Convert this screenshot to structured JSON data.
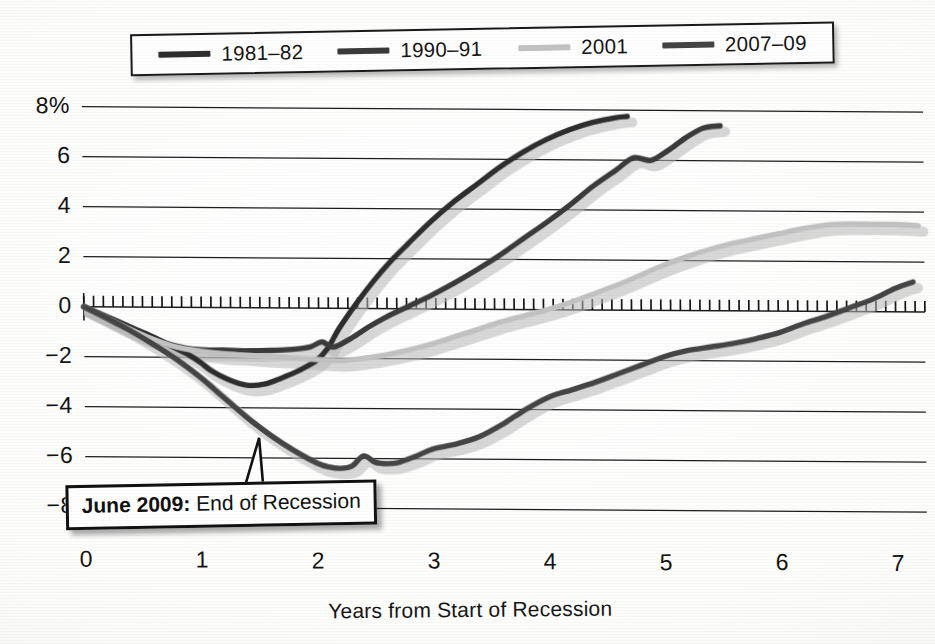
{
  "figure": {
    "background_color": "#fdfdfb",
    "ink_color": "#1a1a1a"
  },
  "legend": {
    "position": "top",
    "entries": [
      {
        "label": "1981–82",
        "color": "#2e2e2e"
      },
      {
        "label": "1990–91",
        "color": "#3a3a3a"
      },
      {
        "label": "2001",
        "color": "#c2c2c2"
      },
      {
        "label": "2007–09",
        "color": "#444444"
      }
    ]
  },
  "axes": {
    "y_ticks": [
      "8%",
      "6",
      "4",
      "2",
      "0",
      "−2",
      "−4",
      "−6",
      "−8"
    ],
    "x_ticks": [
      "0",
      "1",
      "2",
      "3",
      "4",
      "5",
      "6",
      "7"
    ],
    "x_title": "Years from Start of Recession",
    "y_title": ""
  },
  "annotation": {
    "bold_text": "June 2009:",
    "text": " End of Recession",
    "points_to_series": "2007–09",
    "points_to_x": 1.5,
    "points_to_y": -5.2
  },
  "chart_data": {
    "type": "line",
    "title": "",
    "subtitle": "",
    "xlabel": "Years from Start of Recession",
    "ylabel": "Percent change in employment from start of recession",
    "xlim": [
      0,
      7.25
    ],
    "ylim": [
      -8.6,
      8.6
    ],
    "grid": true,
    "gridlines_y": [
      8,
      6,
      4,
      2,
      0,
      -2,
      -4,
      -6,
      -8
    ],
    "zero_axis_ticks": true,
    "legend_position": "top",
    "series": [
      {
        "name": "1981–82",
        "color": "#2e2e2e",
        "x": [
          0,
          0.15,
          0.3,
          0.45,
          0.6,
          0.75,
          0.9,
          1.0,
          1.1,
          1.25,
          1.4,
          1.55,
          1.7,
          1.85,
          2.0,
          2.1,
          2.2,
          2.35,
          2.5,
          2.65,
          2.8,
          3.0,
          3.2,
          3.4,
          3.6,
          3.8,
          4.0,
          4.2,
          4.4,
          4.6,
          4.7
        ],
        "values": [
          0,
          -0.3,
          -0.6,
          -0.9,
          -1.2,
          -1.55,
          -1.9,
          -2.2,
          -2.55,
          -2.9,
          -3.1,
          -3.05,
          -2.8,
          -2.5,
          -2.1,
          -1.6,
          -0.8,
          0.2,
          1.1,
          1.9,
          2.6,
          3.5,
          4.3,
          5.0,
          5.7,
          6.3,
          6.8,
          7.2,
          7.5,
          7.7,
          7.75
        ]
      },
      {
        "name": "1990–91",
        "color": "#3a3a3a",
        "x": [
          0,
          0.15,
          0.3,
          0.45,
          0.6,
          0.75,
          0.9,
          1.05,
          1.2,
          1.4,
          1.6,
          1.8,
          1.95,
          2.05,
          2.15,
          2.3,
          2.45,
          2.6,
          2.8,
          3.0,
          3.2,
          3.4,
          3.6,
          3.8,
          4.0,
          4.2,
          4.4,
          4.6,
          4.75,
          4.9,
          5.05,
          5.2,
          5.35,
          5.5
        ],
        "values": [
          0,
          -0.35,
          -0.7,
          -1.0,
          -1.3,
          -1.5,
          -1.65,
          -1.7,
          -1.7,
          -1.72,
          -1.7,
          -1.65,
          -1.55,
          -1.35,
          -1.55,
          -1.2,
          -0.75,
          -0.35,
          0.1,
          0.55,
          1.05,
          1.6,
          2.2,
          2.85,
          3.5,
          4.2,
          4.95,
          5.6,
          6.1,
          6.0,
          6.4,
          6.9,
          7.3,
          7.4
        ]
      },
      {
        "name": "2001",
        "color": "#c2c2c2",
        "x": [
          0,
          0.2,
          0.4,
          0.6,
          0.8,
          1.0,
          1.2,
          1.4,
          1.6,
          1.8,
          2.0,
          2.2,
          2.4,
          2.6,
          2.8,
          3.0,
          3.2,
          3.4,
          3.6,
          3.8,
          4.0,
          4.2,
          4.4,
          4.6,
          4.8,
          5.0,
          5.2,
          5.4,
          5.6,
          5.8,
          6.0,
          6.2,
          6.4,
          6.6,
          6.8,
          7.0,
          7.2
        ],
        "values": [
          0,
          -0.45,
          -0.9,
          -1.3,
          -1.6,
          -1.75,
          -1.85,
          -1.9,
          -1.95,
          -2.0,
          -2.05,
          -2.1,
          -2.0,
          -1.85,
          -1.65,
          -1.4,
          -1.1,
          -0.8,
          -0.5,
          -0.25,
          0.0,
          0.3,
          0.65,
          1.0,
          1.4,
          1.8,
          2.15,
          2.45,
          2.7,
          2.9,
          3.1,
          3.3,
          3.45,
          3.5,
          3.5,
          3.5,
          3.45
        ]
      },
      {
        "name": "2007–09",
        "color": "#444444",
        "x": [
          0,
          0.2,
          0.4,
          0.6,
          0.8,
          1.0,
          1.2,
          1.4,
          1.6,
          1.8,
          2.0,
          2.1,
          2.2,
          2.3,
          2.4,
          2.5,
          2.6,
          2.7,
          2.85,
          3.0,
          3.2,
          3.4,
          3.6,
          3.8,
          4.0,
          4.2,
          4.4,
          4.6,
          4.8,
          5.0,
          5.2,
          5.4,
          5.6,
          5.8,
          6.0,
          6.2,
          6.4,
          6.6,
          6.8,
          7.0,
          7.15
        ],
        "values": [
          0,
          -0.45,
          -0.95,
          -1.5,
          -2.1,
          -2.8,
          -3.6,
          -4.4,
          -5.1,
          -5.7,
          -6.2,
          -6.35,
          -6.4,
          -6.3,
          -5.9,
          -6.15,
          -6.2,
          -6.15,
          -5.9,
          -5.6,
          -5.4,
          -5.1,
          -4.6,
          -4.0,
          -3.5,
          -3.2,
          -2.9,
          -2.55,
          -2.2,
          -1.85,
          -1.6,
          -1.45,
          -1.3,
          -1.1,
          -0.85,
          -0.5,
          -0.2,
          0.15,
          0.5,
          0.95,
          1.2
        ]
      }
    ]
  }
}
